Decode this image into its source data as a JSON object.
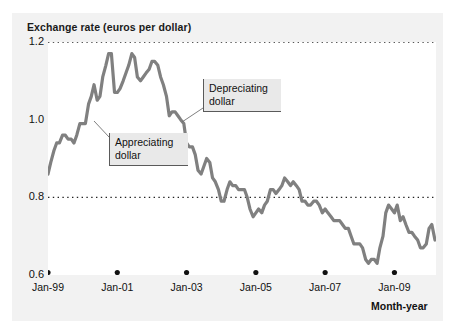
{
  "figure": {
    "title": "Exchange rate (euros per dollar)",
    "x_axis_title": "Month-year",
    "line_color": "#808080",
    "gridline_color": "#222222",
    "panel_color": "#f2f2f2",
    "plot_background": "#ffffff",
    "callout_background": "#e9e9e9"
  },
  "annotations": [
    {
      "id": "appreciating",
      "text": "Appreciating\ndollar"
    },
    {
      "id": "depreciating",
      "text": "Depreciating\ndollar"
    }
  ],
  "chart_data": {
    "type": "line",
    "title": "Exchange rate (euros per dollar)",
    "xlabel": "Month-year",
    "ylabel": "Exchange rate (euros per dollar)",
    "ylim": [
      0.6,
      1.2
    ],
    "yticks": [
      0.6,
      0.8,
      1.0,
      1.2
    ],
    "ytick_labels": [
      "0.6",
      "0.8",
      "1.0",
      "1.2"
    ],
    "gridlines": [
      0.8,
      1.2
    ],
    "grid": "horizontal-dotted",
    "legend": "none",
    "xticks": [
      "Jan-99",
      "Jan-01",
      "Jan-03",
      "Jan-05",
      "Jan-07",
      "Jan-09"
    ],
    "xtick_positions_years": [
      1999.0,
      2001.0,
      2003.0,
      2005.0,
      2007.0,
      2009.0
    ],
    "xlim_years": [
      1999.0,
      2010.2
    ],
    "series": [
      {
        "name": "Euros per dollar",
        "x": [
          1999.0,
          1999.08,
          1999.17,
          1999.25,
          1999.33,
          1999.42,
          1999.5,
          1999.58,
          1999.67,
          1999.75,
          1999.83,
          1999.92,
          2000.0,
          2000.08,
          2000.17,
          2000.25,
          2000.33,
          2000.42,
          2000.5,
          2000.58,
          2000.67,
          2000.75,
          2000.83,
          2000.92,
          2001.0,
          2001.08,
          2001.17,
          2001.25,
          2001.33,
          2001.42,
          2001.5,
          2001.58,
          2001.67,
          2001.75,
          2001.83,
          2001.92,
          2002.0,
          2002.08,
          2002.17,
          2002.25,
          2002.33,
          2002.42,
          2002.5,
          2002.58,
          2002.67,
          2002.75,
          2002.83,
          2002.92,
          2003.0,
          2003.08,
          2003.17,
          2003.25,
          2003.33,
          2003.42,
          2003.5,
          2003.58,
          2003.67,
          2003.75,
          2003.83,
          2003.92,
          2004.0,
          2004.08,
          2004.17,
          2004.25,
          2004.33,
          2004.42,
          2004.5,
          2004.58,
          2004.67,
          2004.75,
          2004.83,
          2004.92,
          2005.0,
          2005.08,
          2005.17,
          2005.25,
          2005.33,
          2005.42,
          2005.5,
          2005.58,
          2005.67,
          2005.75,
          2005.83,
          2005.92,
          2006.0,
          2006.08,
          2006.17,
          2006.25,
          2006.33,
          2006.42,
          2006.5,
          2006.58,
          2006.67,
          2006.75,
          2006.83,
          2006.92,
          2007.0,
          2007.08,
          2007.17,
          2007.25,
          2007.33,
          2007.42,
          2007.5,
          2007.58,
          2007.67,
          2007.75,
          2007.83,
          2007.92,
          2008.0,
          2008.08,
          2008.17,
          2008.25,
          2008.33,
          2008.42,
          2008.5,
          2008.58,
          2008.67,
          2008.75,
          2008.83,
          2008.92,
          2009.0,
          2009.08,
          2009.17,
          2009.25,
          2009.33,
          2009.42,
          2009.5,
          2009.58,
          2009.67,
          2009.75,
          2009.83,
          2009.92,
          2010.0,
          2010.08,
          2010.17
        ],
        "values": [
          0.86,
          0.89,
          0.92,
          0.94,
          0.94,
          0.96,
          0.96,
          0.95,
          0.95,
          0.94,
          0.96,
          0.99,
          0.99,
          0.99,
          1.04,
          1.06,
          1.09,
          1.05,
          1.06,
          1.11,
          1.14,
          1.17,
          1.17,
          1.07,
          1.07,
          1.08,
          1.1,
          1.12,
          1.14,
          1.17,
          1.16,
          1.11,
          1.1,
          1.11,
          1.12,
          1.13,
          1.15,
          1.15,
          1.14,
          1.11,
          1.09,
          1.06,
          1.01,
          1.02,
          1.02,
          1.01,
          1.0,
          0.99,
          0.94,
          0.93,
          0.93,
          0.91,
          0.87,
          0.86,
          0.88,
          0.9,
          0.89,
          0.85,
          0.84,
          0.82,
          0.79,
          0.79,
          0.82,
          0.84,
          0.83,
          0.83,
          0.82,
          0.82,
          0.82,
          0.8,
          0.77,
          0.75,
          0.76,
          0.77,
          0.76,
          0.78,
          0.79,
          0.82,
          0.82,
          0.81,
          0.82,
          0.83,
          0.85,
          0.84,
          0.83,
          0.84,
          0.83,
          0.82,
          0.79,
          0.79,
          0.78,
          0.78,
          0.79,
          0.79,
          0.78,
          0.76,
          0.77,
          0.76,
          0.75,
          0.74,
          0.74,
          0.74,
          0.73,
          0.72,
          0.72,
          0.7,
          0.68,
          0.68,
          0.68,
          0.67,
          0.64,
          0.63,
          0.64,
          0.64,
          0.63,
          0.67,
          0.7,
          0.76,
          0.78,
          0.77,
          0.76,
          0.78,
          0.74,
          0.75,
          0.73,
          0.71,
          0.71,
          0.7,
          0.69,
          0.67,
          0.67,
          0.68,
          0.72,
          0.73,
          0.69
        ]
      }
    ]
  }
}
